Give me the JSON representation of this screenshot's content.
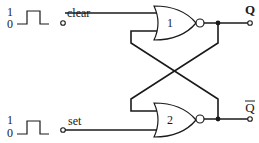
{
  "diagram": {
    "inputs": {
      "clear": {
        "label": "clear",
        "pulse_high": "1",
        "pulse_low": "0"
      },
      "set": {
        "label": "set",
        "pulse_high": "1",
        "pulse_low": "0"
      }
    },
    "gates": [
      {
        "id": "1",
        "type": "NOR",
        "label": "1"
      },
      {
        "id": "2",
        "type": "NOR",
        "label": "2"
      }
    ],
    "outputs": {
      "q": {
        "label": "Q"
      },
      "q_bar": {
        "label": "Q",
        "overline": true
      }
    },
    "colors": {
      "line": "#1a1a1a",
      "background": "#ffffff"
    }
  }
}
